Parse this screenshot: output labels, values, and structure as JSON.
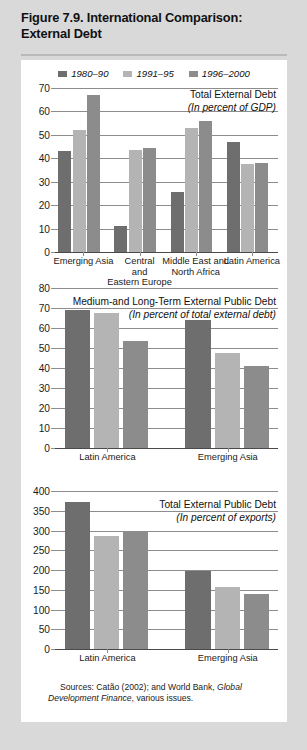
{
  "figure": {
    "title": "Figure 7.9.  International Comparison: External Debt",
    "source_note": "Sources: Catão (2002); and World Bank, Global Development Finance, various issues."
  },
  "legend": {
    "items": [
      {
        "label": "1980–90",
        "color": "#6e6e6e"
      },
      {
        "label": "1991–95",
        "color": "#b4b4b4"
      },
      {
        "label": "1996–2000",
        "color": "#8c8c8c"
      }
    ]
  },
  "colors": {
    "series1": "#6e6e6e",
    "series2": "#b4b4b4",
    "series3": "#8c8c8c",
    "gridline": "#8d8d8d",
    "panel_background": "#ffffff",
    "page_background": "#d9d9d9"
  },
  "chart_data": [
    {
      "id": "chart1",
      "type": "bar",
      "title": "Total External Debt",
      "subtitle": "(In percent of GDP)",
      "xlabel": "",
      "ylabel": "",
      "ylim": [
        0,
        70
      ],
      "yticks": [
        0,
        10,
        20,
        30,
        40,
        50,
        60,
        70
      ],
      "grid": true,
      "legend_position": "top-center",
      "categories": [
        "Emerging Asia",
        "Central and Eastern Europe",
        "Middle East and North Africa",
        "Latin America"
      ],
      "category_lines": [
        [
          "Emerging Asia"
        ],
        [
          "Central",
          "and",
          "Eastern Europe"
        ],
        [
          "Middle East and",
          "North Africa"
        ],
        [
          "Latin America"
        ]
      ],
      "series": [
        {
          "name": "1980–90",
          "values": [
            43.0,
            11.2,
            25.6,
            47.0
          ]
        },
        {
          "name": "1991–95",
          "values": [
            52.0,
            43.5,
            53.0,
            37.6
          ]
        },
        {
          "name": "1996–2000",
          "values": [
            67.0,
            44.2,
            56.0,
            38.0
          ]
        }
      ]
    },
    {
      "id": "chart2",
      "type": "bar",
      "title": "Medium-and Long-Term External Public Debt",
      "subtitle": "(In percent of total external debt)",
      "xlabel": "",
      "ylabel": "",
      "ylim": [
        0,
        80
      ],
      "yticks": [
        0,
        10,
        20,
        30,
        40,
        50,
        60,
        70,
        80
      ],
      "grid": true,
      "legend_position": "none",
      "categories": [
        "Latin America",
        "Emerging Asia"
      ],
      "category_lines": [
        [
          "Latin America"
        ],
        [
          "Emerging Asia"
        ]
      ],
      "series": [
        {
          "name": "1980–90",
          "values": [
            69.0,
            64.0
          ]
        },
        {
          "name": "1991–95",
          "values": [
            67.5,
            47.6
          ]
        },
        {
          "name": "1996–2000",
          "values": [
            53.5,
            41.0
          ]
        }
      ]
    },
    {
      "id": "chart3",
      "type": "bar",
      "title": "Total External Public Debt",
      "subtitle": "(In percent of exports)",
      "xlabel": "",
      "ylabel": "",
      "ylim": [
        0,
        400
      ],
      "yticks": [
        0,
        50,
        100,
        150,
        200,
        250,
        300,
        350,
        400
      ],
      "grid": true,
      "legend_position": "none",
      "categories": [
        "Latin America",
        "Emerging Asia"
      ],
      "category_lines": [
        [
          "Latin America"
        ],
        [
          "Emerging Asia"
        ]
      ],
      "series": [
        {
          "name": "1980–90",
          "values": [
            373.0,
            198.0
          ]
        },
        {
          "name": "1991–95",
          "values": [
            287.0,
            158.0
          ]
        },
        {
          "name": "1996–2000",
          "values": [
            299.0,
            140.0
          ]
        }
      ]
    }
  ]
}
